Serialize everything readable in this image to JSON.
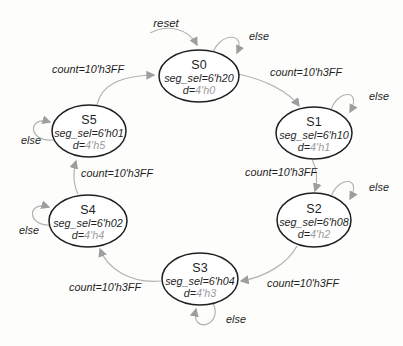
{
  "diagram": {
    "type": "finite-state-machine",
    "reset_label": "reset",
    "arrow_color": "#b3b3b3",
    "state_stroke_color": "#1f1f1f",
    "d_value_color": "#9c9c9c"
  },
  "states": [
    {
      "name": "S0",
      "seg_sel": "seg_sel=6'h20",
      "d_prefix": "d=",
      "d_value": "4'h0",
      "self_loop": "else"
    },
    {
      "name": "S1",
      "seg_sel": "seg_sel=6'h10",
      "d_prefix": "d=",
      "d_value": "4'h1",
      "self_loop": "else"
    },
    {
      "name": "S2",
      "seg_sel": "seg_sel=6'h08",
      "d_prefix": "d=",
      "d_value": "4'h2",
      "self_loop": "else"
    },
    {
      "name": "S3",
      "seg_sel": "seg_sel=6'h04",
      "d_prefix": "d=",
      "d_value": "4'h3",
      "self_loop": "else"
    },
    {
      "name": "S4",
      "seg_sel": "seg_sel=6'h02",
      "d_prefix": "d=",
      "d_value": "4'h4",
      "self_loop": "else"
    },
    {
      "name": "S5",
      "seg_sel": "seg_sel=6'h01",
      "d_prefix": "d=",
      "d_value": "4'h5",
      "self_loop": "else"
    }
  ],
  "transitions": [
    {
      "from": "S0",
      "to": "S1",
      "label": "count=10'h3FF"
    },
    {
      "from": "S1",
      "to": "S2",
      "label": "count=10'h3FF"
    },
    {
      "from": "S2",
      "to": "S3",
      "label": "count=10'h3FF"
    },
    {
      "from": "S3",
      "to": "S4",
      "label": "count=10'h3FF"
    },
    {
      "from": "S4",
      "to": "S5",
      "label": "count=10'h3FF"
    },
    {
      "from": "S5",
      "to": "S0",
      "label": "count=10'h3FF"
    }
  ]
}
